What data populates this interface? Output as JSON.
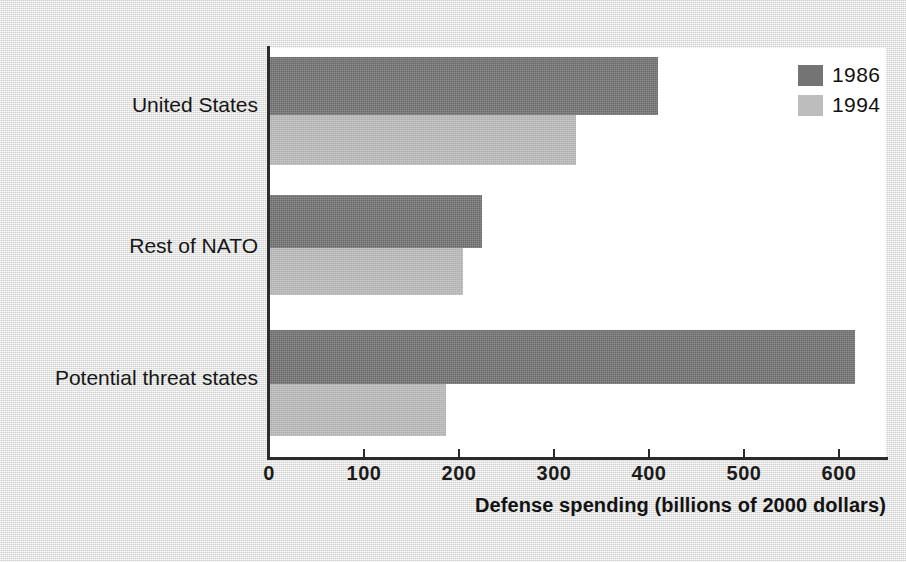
{
  "figure": {
    "background_color": "#e8e8e7",
    "plot_background_color": "#ffffff",
    "axis_color": "#2b2b2b"
  },
  "legend": {
    "position": "top-right",
    "entries": [
      {
        "label": "1986",
        "color": "#747474",
        "swatch_name": "legend-swatch-1986"
      },
      {
        "label": "1994",
        "color": "#bdbdbd",
        "swatch_name": "legend-swatch-1994"
      }
    ]
  },
  "axis": {
    "title": "Defense spending (billions of 2000 dollars)",
    "tick_labels": [
      "0",
      "100",
      "200",
      "300",
      "400",
      "500",
      "600"
    ]
  },
  "categories": [
    {
      "label": "United States"
    },
    {
      "label": "Rest of NATO"
    },
    {
      "label": "Potential threat states"
    }
  ],
  "chart_data": {
    "type": "bar",
    "orientation": "horizontal",
    "title": "",
    "subtitle": "",
    "xlabel": "Defense spending (billions of 2000 dollars)",
    "ylabel": "",
    "categories": [
      "United States",
      "Rest of NATO",
      "Potential threat states"
    ],
    "series": [
      {
        "name": "1986",
        "color": "#747474",
        "values": [
          410,
          225,
          618
        ]
      },
      {
        "name": "1994",
        "color": "#bdbdbd",
        "values": [
          324,
          205,
          187
        ]
      }
    ],
    "xlim": [
      0,
      650
    ],
    "xticks": [
      0,
      100,
      200,
      300,
      400,
      500,
      600
    ],
    "tick_labels": [
      "0",
      "100",
      "200",
      "300",
      "400",
      "500",
      "600"
    ],
    "grid": false,
    "legend_position": "top-right",
    "units": "billions of 2000 dollars"
  },
  "geometry": {
    "plot_left_px": 268,
    "plot_top_px": 48,
    "plot_width_px": 618,
    "plot_height_px": 410,
    "px_per_unit": 0.9505,
    "groups": [
      {
        "top_px": 57,
        "bar_height_px": 58,
        "gap_px": 0,
        "second_top_px": 115,
        "second_height_px": 50,
        "label_center_px": 100
      },
      {
        "top_px": 195,
        "bar_height_px": 53,
        "second_top_px": 248,
        "second_height_px": 47,
        "label_center_px": 243
      },
      {
        "top_px": 330,
        "bar_height_px": 54,
        "second_top_px": 384,
        "second_height_px": 52,
        "label_center_px": 375
      }
    ]
  }
}
